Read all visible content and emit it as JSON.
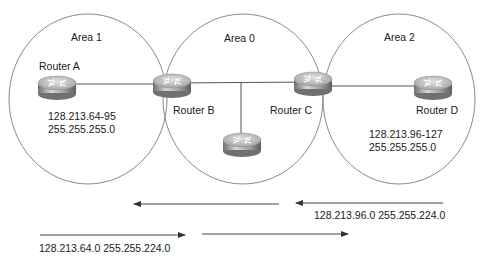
{
  "areas": [
    {
      "label": "Area 1",
      "cx": 88,
      "cy": 99,
      "rx": 79,
      "ry": 85
    },
    {
      "label": "Area 0",
      "cx": 243,
      "cy": 99,
      "rx": 80,
      "ry": 85
    },
    {
      "label": "Area 2",
      "cx": 399,
      "cy": 99,
      "rx": 76,
      "ry": 85
    }
  ],
  "routers": [
    {
      "label": "Router A",
      "cx": 57,
      "cy": 86
    },
    {
      "label": "Router B",
      "cx": 172,
      "cy": 84
    },
    {
      "label": "Router C",
      "cx": 313,
      "cy": 82
    },
    {
      "label": "Router D",
      "cx": 433,
      "cy": 86
    },
    {
      "label": "",
      "cx": 242,
      "cy": 143
    }
  ],
  "subnets": {
    "area1": {
      "range": "128.213.64-95",
      "mask": "255.255.255.0"
    },
    "area2": {
      "range": "128.213.96-127",
      "mask": "255.255.255.0"
    }
  },
  "summaries": {
    "area2_to_backbone": "128.213.96.0 255.255.224.0",
    "area1_to_backbone": "128.213.64.0 255.255.224.0"
  },
  "colors": {
    "line": "#555555",
    "circle": "#8a8a8a",
    "router_top": "#cfcfcf",
    "router_side": "#8c8c8c"
  }
}
